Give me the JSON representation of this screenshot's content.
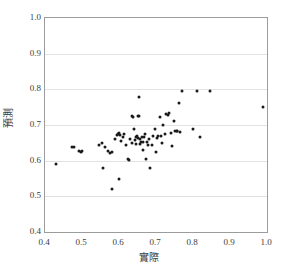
{
  "chart_data": {
    "type": "scatter",
    "title": "",
    "xlabel": "實際",
    "ylabel": "預測",
    "xlim": [
      0.4,
      1.0
    ],
    "ylim": [
      0.4,
      1.0
    ],
    "xticks": [
      "0.4",
      "0.5",
      "0.6",
      "0.7",
      "0.8",
      "0.9",
      "1.0"
    ],
    "yticks": [
      "1.0",
      "0.9",
      "0.8",
      "0.7",
      "0.6",
      "0.5",
      "0.4"
    ],
    "xtick_values": [
      0.4,
      0.5,
      0.6,
      0.7,
      0.8,
      0.9,
      1.0
    ],
    "ytick_values": [
      1.0,
      0.9,
      0.8,
      0.7,
      0.6,
      0.5,
      0.4
    ],
    "grid": "horizontal",
    "legend": "none",
    "marker": "filled-circle",
    "marker_color": "#1a1a1a",
    "frame_color": "#9c9c9c",
    "gridline_color": "#e2e2e2",
    "points": [
      [
        0.43,
        0.59
      ],
      [
        0.472,
        0.638
      ],
      [
        0.479,
        0.637
      ],
      [
        0.492,
        0.628
      ],
      [
        0.497,
        0.625
      ],
      [
        0.5,
        0.626
      ],
      [
        0.545,
        0.645
      ],
      [
        0.553,
        0.649
      ],
      [
        0.557,
        0.58
      ],
      [
        0.563,
        0.637
      ],
      [
        0.57,
        0.626
      ],
      [
        0.575,
        0.622
      ],
      [
        0.58,
        0.52
      ],
      [
        0.582,
        0.625
      ],
      [
        0.588,
        0.66
      ],
      [
        0.594,
        0.672
      ],
      [
        0.597,
        0.676
      ],
      [
        0.599,
        0.55
      ],
      [
        0.601,
        0.677
      ],
      [
        0.604,
        0.672
      ],
      [
        0.606,
        0.656
      ],
      [
        0.61,
        0.666
      ],
      [
        0.613,
        0.675
      ],
      [
        0.62,
        0.645
      ],
      [
        0.624,
        0.604
      ],
      [
        0.628,
        0.602
      ],
      [
        0.631,
        0.661
      ],
      [
        0.634,
        0.65
      ],
      [
        0.636,
        0.724
      ],
      [
        0.638,
        0.722
      ],
      [
        0.64,
        0.69
      ],
      [
        0.642,
        0.657
      ],
      [
        0.645,
        0.648
      ],
      [
        0.647,
        0.665
      ],
      [
        0.648,
        0.668
      ],
      [
        0.65,
        0.663
      ],
      [
        0.652,
        0.726
      ],
      [
        0.654,
        0.725
      ],
      [
        0.655,
        0.778
      ],
      [
        0.656,
        0.66
      ],
      [
        0.658,
        0.646
      ],
      [
        0.66,
        0.653
      ],
      [
        0.662,
        0.665
      ],
      [
        0.664,
        0.651
      ],
      [
        0.666,
        0.63
      ],
      [
        0.668,
        0.667
      ],
      [
        0.671,
        0.676
      ],
      [
        0.674,
        0.604
      ],
      [
        0.676,
        0.652
      ],
      [
        0.679,
        0.643
      ],
      [
        0.682,
        0.66
      ],
      [
        0.685,
        0.58
      ],
      [
        0.688,
        0.645
      ],
      [
        0.692,
        0.67
      ],
      [
        0.696,
        0.69
      ],
      [
        0.7,
        0.623
      ],
      [
        0.703,
        0.664
      ],
      [
        0.706,
        0.668
      ],
      [
        0.71,
        0.722
      ],
      [
        0.713,
        0.67
      ],
      [
        0.716,
        0.649
      ],
      [
        0.72,
        0.7
      ],
      [
        0.724,
        0.676
      ],
      [
        0.728,
        0.73
      ],
      [
        0.732,
        0.728
      ],
      [
        0.736,
        0.735
      ],
      [
        0.74,
        0.678
      ],
      [
        0.744,
        0.64
      ],
      [
        0.748,
        0.712
      ],
      [
        0.752,
        0.682
      ],
      [
        0.756,
        0.684
      ],
      [
        0.758,
        0.683
      ],
      [
        0.762,
        0.763
      ],
      [
        0.765,
        0.68
      ],
      [
        0.77,
        0.795
      ],
      [
        0.8,
        0.69
      ],
      [
        0.81,
        0.795
      ],
      [
        0.818,
        0.665
      ],
      [
        0.845,
        0.794
      ],
      [
        0.99,
        0.75
      ]
    ],
    "n_points": 80
  }
}
